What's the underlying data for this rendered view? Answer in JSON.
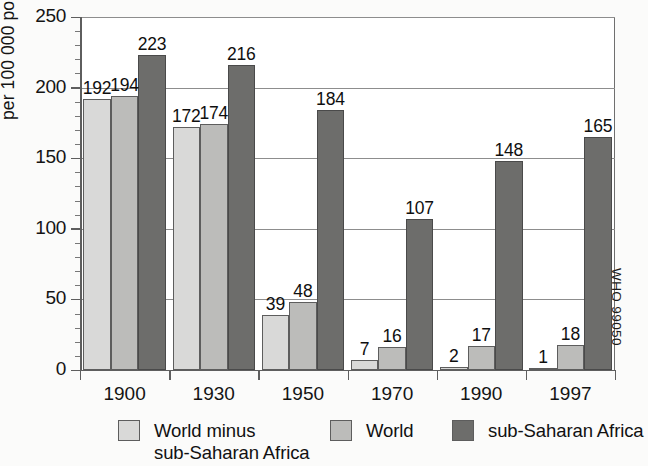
{
  "chart_data": {
    "type": "bar",
    "title": "",
    "subtitle": "",
    "xlabel": "",
    "ylabel": "per 100 000 population",
    "categories": [
      "1900",
      "1930",
      "1950",
      "1970",
      "1990",
      "1997"
    ],
    "series": [
      {
        "name": "World minus sub-Saharan Africa",
        "color": "#d9d9d8",
        "values": [
          192,
          172,
          39,
          7,
          2,
          1
        ]
      },
      {
        "name": "World",
        "color": "#bcbcba",
        "values": [
          194,
          174,
          48,
          16,
          17,
          18
        ]
      },
      {
        "name": "sub-Saharan Africa",
        "color": "#6d6d6b",
        "values": [
          223,
          216,
          184,
          107,
          148,
          165
        ]
      }
    ],
    "ylim": [
      0,
      250
    ],
    "y_major_ticks": [
      0,
      50,
      100,
      150,
      200,
      250
    ],
    "y_minor_tick_step": 10,
    "grid": "horizontal-major",
    "legend_position": "bottom",
    "data_labels": true,
    "source_code": "WHO 99050"
  },
  "axis": {
    "y_tick_labels": [
      "250",
      "200",
      "150",
      "100",
      "50",
      "0"
    ],
    "x_tick_labels": [
      "1900",
      "1930",
      "1950",
      "1970",
      "1990",
      "1997"
    ],
    "y_title": "per 100 000 population"
  },
  "legend": {
    "items": [
      {
        "label": "World minus\nsub-Saharan Africa",
        "color": "#d9d9d8"
      },
      {
        "label": "World",
        "color": "#bcbcba"
      },
      {
        "label": "sub-Saharan Africa",
        "color": "#6d6d6b"
      }
    ]
  },
  "footer": {
    "who_code": "WHO 99050"
  }
}
